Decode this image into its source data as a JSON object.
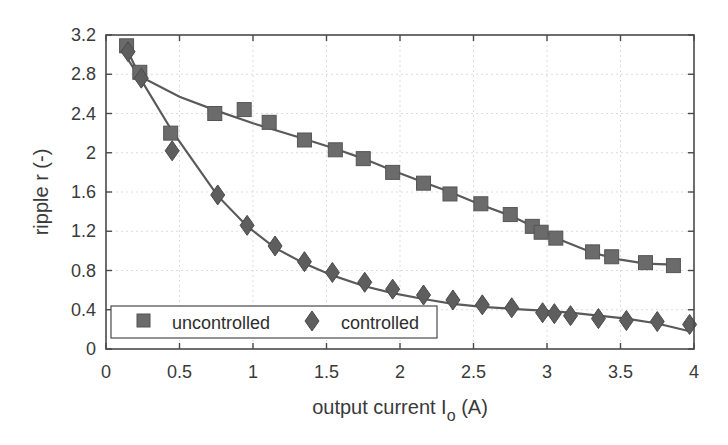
{
  "chart_data": {
    "type": "scatter",
    "title": "",
    "xlabel": "output current I_o (A)",
    "xlabel_main": "output current I",
    "xlabel_sub": "o",
    "xlabel_unit": "(A)",
    "ylabel": "ripple r (-)",
    "xlim": [
      0,
      4
    ],
    "ylim": [
      0,
      3.2
    ],
    "xticks": [
      "0",
      "0.5",
      "1",
      "1.5",
      "2",
      "2.5",
      "3",
      "3.5",
      "4"
    ],
    "yticks": [
      "0",
      "0.4",
      "0.8",
      "1.2",
      "1.6",
      "2",
      "2.4",
      "2.8",
      "3.2"
    ],
    "grid": true,
    "legend_position": "lower left",
    "colors": {
      "markers": "#6b6b6b",
      "fit_line": "#5a5a5a",
      "frame": "#4a4a4a",
      "grid": "#dcdcdc"
    },
    "series": [
      {
        "name": "uncontrolled",
        "marker": "square",
        "x": [
          0.14,
          0.23,
          0.44,
          0.74,
          0.94,
          1.11,
          1.35,
          1.56,
          1.75,
          1.95,
          2.16,
          2.34,
          2.55,
          2.75,
          2.9,
          2.96,
          3.06,
          3.31,
          3.44,
          3.67,
          3.86
        ],
        "y": [
          3.09,
          2.82,
          2.2,
          2.4,
          2.44,
          2.31,
          2.13,
          2.03,
          1.94,
          1.8,
          1.69,
          1.58,
          1.48,
          1.37,
          1.25,
          1.19,
          1.13,
          0.99,
          0.94,
          0.88,
          0.85
        ],
        "fit": {
          "x": [
            0.14,
            0.23,
            0.5,
            0.75,
            1.0,
            1.35,
            1.56,
            1.75,
            1.95,
            2.16,
            2.34,
            2.55,
            2.75,
            2.96,
            3.06,
            3.31,
            3.5,
            3.67,
            3.86
          ],
          "y": [
            3.06,
            2.78,
            2.57,
            2.43,
            2.3,
            2.14,
            2.04,
            1.94,
            1.82,
            1.7,
            1.6,
            1.47,
            1.36,
            1.21,
            1.13,
            0.98,
            0.91,
            0.87,
            0.86
          ]
        }
      },
      {
        "name": "controlled",
        "marker": "diamond",
        "x": [
          0.15,
          0.24,
          0.45,
          0.76,
          0.96,
          1.15,
          1.35,
          1.54,
          1.76,
          1.95,
          2.16,
          2.36,
          2.56,
          2.76,
          2.97,
          3.05,
          3.16,
          3.35,
          3.54,
          3.75,
          3.97
        ],
        "y": [
          3.03,
          2.76,
          2.02,
          1.57,
          1.26,
          1.05,
          0.89,
          0.78,
          0.68,
          0.61,
          0.55,
          0.5,
          0.45,
          0.42,
          0.37,
          0.36,
          0.34,
          0.31,
          0.29,
          0.28,
          0.25
        ],
        "fit": {
          "x": [
            0.12,
            0.24,
            0.45,
            0.76,
            0.96,
            1.15,
            1.35,
            1.54,
            1.76,
            1.95,
            2.16,
            2.36,
            2.56,
            2.76,
            2.97,
            3.16,
            3.35,
            3.54,
            3.75,
            3.97
          ],
          "y": [
            3.02,
            2.74,
            2.22,
            1.56,
            1.25,
            1.03,
            0.87,
            0.75,
            0.64,
            0.57,
            0.51,
            0.46,
            0.43,
            0.41,
            0.39,
            0.37,
            0.34,
            0.31,
            0.26,
            0.18
          ]
        }
      }
    ]
  },
  "legend": {
    "items": [
      {
        "label": "uncontrolled",
        "marker": "square"
      },
      {
        "label": "controlled",
        "marker": "diamond"
      }
    ]
  }
}
